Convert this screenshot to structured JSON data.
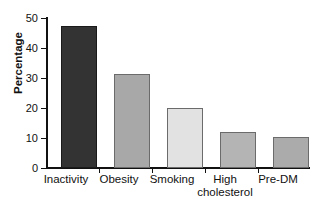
{
  "chart_data": {
    "type": "bar",
    "title": "",
    "subtitle": "",
    "xlabel": "",
    "ylabel": "Percentage",
    "categories": [
      "Inactivity",
      "Obesity",
      "Smoking",
      "High cholesterol",
      "Pre-DM"
    ],
    "category_lines": [
      [
        "Inactivity"
      ],
      [
        "Obesity"
      ],
      [
        "Smoking"
      ],
      [
        "High",
        "cholesterol"
      ],
      [
        "Pre-DM"
      ]
    ],
    "values": [
      47.5,
      31.5,
      20,
      12,
      10.5
    ],
    "ylim": [
      0,
      50
    ],
    "yticks": [
      0,
      10,
      20,
      30,
      40,
      50
    ],
    "ytick_labels": [
      "0",
      "10",
      "20",
      "30",
      "40",
      "50"
    ],
    "grid": false,
    "legend": false,
    "bar_colors": [
      "#333333",
      "#a8a8a8",
      "#e2e2e2",
      "#b4b4b4",
      "#ababab"
    ],
    "bar_edge_color": "#6b6b6b",
    "axis_color": "#111111",
    "background": "#ffffff"
  }
}
